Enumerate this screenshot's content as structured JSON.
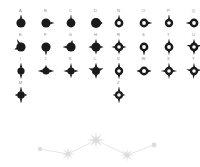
{
  "figure": {
    "background_color": "#ffffff",
    "glyph_color": "#1a1a1a",
    "label_color": "#8a8a8a",
    "constellation_color": "#e2e2e2",
    "constellation_node_color": "#dcdcdc",
    "panel_count": 26,
    "columns_per_block": 4
  },
  "panels_left": [
    {
      "label": "A",
      "shape": "blob-spike-up",
      "filled": true
    },
    {
      "label": "B",
      "shape": "blob-spike-right",
      "filled": true
    },
    {
      "label": "C",
      "shape": "blob-spike-up-narrow",
      "filled": true
    },
    {
      "label": "D",
      "shape": "blob-round",
      "filled": true
    },
    {
      "label": "E",
      "shape": "blob-spike-up-left",
      "filled": true
    },
    {
      "label": "F",
      "shape": "blob-spike-down",
      "filled": true
    },
    {
      "label": "G",
      "shape": "blob-spike-left",
      "filled": true
    },
    {
      "label": "H",
      "shape": "blob-four-point",
      "filled": true
    },
    {
      "label": "I",
      "shape": "diamond-tall",
      "filled": true
    },
    {
      "label": "J",
      "shape": "diamond-wide",
      "filled": true
    },
    {
      "label": "K",
      "shape": "diamond-four-point",
      "filled": true
    },
    {
      "label": "L",
      "shape": "diamond-star",
      "filled": true
    },
    {
      "label": "M",
      "shape": "diamond-tall-star",
      "filled": true
    }
  ],
  "panels_right": [
    {
      "label": "N",
      "shape": "ring-spike-up",
      "filled": false
    },
    {
      "label": "O",
      "shape": "ring-spike-right",
      "filled": false
    },
    {
      "label": "P",
      "shape": "ring-spike-up-tall",
      "filled": false
    },
    {
      "label": "Q",
      "shape": "ring-spike-left",
      "filled": false
    },
    {
      "label": "R",
      "shape": "ring-four-point",
      "filled": false
    },
    {
      "label": "S",
      "shape": "ring-spike-down",
      "filled": false
    },
    {
      "label": "T",
      "shape": "ring-spike-up-down",
      "filled": false
    },
    {
      "label": "U",
      "shape": "ring-star",
      "filled": false
    },
    {
      "label": "V",
      "shape": "ring-diamond",
      "filled": false
    },
    {
      "label": "W",
      "shape": "ring-wide",
      "filled": false
    },
    {
      "label": "X",
      "shape": "ring-four-point-sharp",
      "filled": false
    },
    {
      "label": "Y",
      "shape": "ring-cross-star",
      "filled": false
    },
    {
      "label": "Z",
      "shape": "ring-diamond-tall",
      "filled": false
    }
  ],
  "constellation": {
    "name": "constellation-diagram",
    "nodes": [
      {
        "id": "n1",
        "x": 6,
        "y": 27,
        "type": "dot",
        "size": 2.2
      },
      {
        "id": "n2",
        "x": 34,
        "y": 32,
        "type": "star",
        "size": 7
      },
      {
        "id": "n3",
        "x": 62,
        "y": 18,
        "type": "star",
        "size": 9
      },
      {
        "id": "n4",
        "x": 93,
        "y": 33,
        "type": "star",
        "size": 7
      },
      {
        "id": "n5",
        "x": 120,
        "y": 23,
        "type": "dot",
        "size": 2.4
      }
    ],
    "edges": [
      {
        "from": "n1",
        "to": "n2"
      },
      {
        "from": "n2",
        "to": "n3"
      },
      {
        "from": "n3",
        "to": "n4"
      },
      {
        "from": "n4",
        "to": "n5"
      }
    ]
  }
}
